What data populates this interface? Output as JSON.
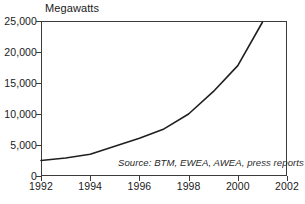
{
  "chart_data": {
    "type": "line",
    "title": "",
    "subtitle": "",
    "ylabel": "Megawatts",
    "xlabel": "",
    "xlim": [
      1992,
      2002
    ],
    "ylim": [
      0,
      25000
    ],
    "grid": false,
    "legend": null,
    "annotations": [
      "Source: BTM, EWEA, AWEA, press reports"
    ],
    "ytick_labels": [
      "0",
      "5,000",
      "10,000",
      "15,000",
      "20,000",
      "25,000"
    ],
    "ytick_values": [
      0,
      5000,
      10000,
      15000,
      20000,
      25000
    ],
    "xtick_labels": [
      "1992",
      "1994",
      "1996",
      "1998",
      "2000",
      "2002"
    ],
    "xtick_values": [
      1992,
      1994,
      1996,
      1998,
      2000,
      2002
    ],
    "series": [
      {
        "name": "World Wind Energy Generating Capacity",
        "x": [
          1992,
          1993,
          1994,
          1995,
          1996,
          1997,
          1998,
          1999,
          2000,
          2001
        ],
        "values": [
          2500,
          2900,
          3500,
          4800,
          6100,
          7600,
          10000,
          13600,
          17800,
          24800
        ]
      }
    ]
  },
  "source_note": "Source: BTM, EWEA, AWEA, press reports",
  "colors": {
    "axis": "#3b3b3b",
    "line": "#1f1f1f",
    "text": "#1a1a1a",
    "background": "#ffffff"
  }
}
